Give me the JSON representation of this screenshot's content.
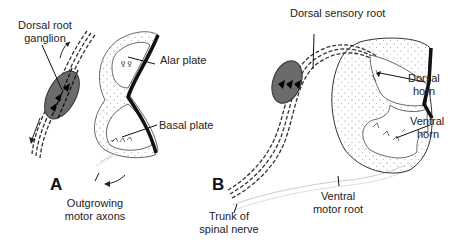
{
  "figure": {
    "panel_a": {
      "letter": "A",
      "labels": {
        "dorsal_root_ganglion_1": "Dorsal root",
        "dorsal_root_ganglion_2": "ganglion",
        "alar_plate": "Alar plate",
        "basal_plate": "Basal plate",
        "outgrowing_motor_axons_1": "Outgrowing",
        "outgrowing_motor_axons_2": "motor axons"
      }
    },
    "panel_b": {
      "letter": "B",
      "labels": {
        "dorsal_sensory_root": "Dorsal sensory root",
        "dorsal_horn_1": "Dorsal",
        "dorsal_horn_2": "horn",
        "ventral_horn_1": "Ventral",
        "ventral_horn_2": "horn",
        "trunk_of_spinal_nerve_1": "Trunk of",
        "trunk_of_spinal_nerve_2": "spinal nerve",
        "ventral_motor_root_1": "Ventral",
        "ventral_motor_root_2": "motor root"
      }
    },
    "colors": {
      "ganglion_fill": "#6b6b6b",
      "outline": "#222222",
      "thick_border": "#111111"
    }
  }
}
